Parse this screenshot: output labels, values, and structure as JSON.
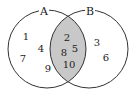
{
  "diagram": {
    "type": "venn",
    "sets": [
      {
        "label": "A",
        "only": [
          "1",
          "4",
          "7",
          "9"
        ]
      },
      {
        "label": "B",
        "only": [
          "3",
          "6"
        ]
      }
    ],
    "intersection": [
      "2",
      "5",
      "8",
      "10"
    ],
    "colors": {
      "stroke": "#333333",
      "intersection_fill": "#c8c8c8",
      "background": "#ffffff"
    }
  }
}
